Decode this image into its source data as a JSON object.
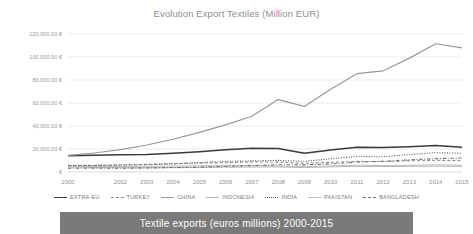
{
  "caption": {
    "text": "Textile exports (euros millions) 2000-2015",
    "bar_color": "#7a7a7a",
    "text_color": "#ffffff"
  },
  "chart_data": {
    "type": "line",
    "title": "Evolution Export Textiles (Million EUR)",
    "xlabel": "",
    "ylabel": "",
    "grid": true,
    "legend_position": "bottom",
    "ylim": [
      0,
      120000
    ],
    "ytick_values": [
      0,
      20000,
      40000,
      60000,
      80000,
      100000,
      120000
    ],
    "ytick_labels": [
      "-   €",
      "20,000.00 €",
      "40,000.00 €",
      "60,000.00 €",
      "80,000.00 €",
      "100,000.00 €",
      "120,000.00 €"
    ],
    "categories": [
      2000,
      2001,
      2002,
      2003,
      2004,
      2005,
      2006,
      2007,
      2008,
      2009,
      2010,
      2011,
      2012,
      2013,
      2014,
      2015
    ],
    "xtick_labels": [
      "2000",
      "2001",
      "2002",
      "2003",
      "2004",
      "2005",
      "2006",
      "2007",
      "2008",
      "2009",
      "2010",
      "2011",
      "2012",
      "2013",
      "2014",
      "2015"
    ],
    "xtick_visible": [
      "2000",
      "2002",
      "2003",
      "2004",
      "2005",
      "2006",
      "2007",
      "2008",
      "2009",
      "2010",
      "2011",
      "2012",
      "2013",
      "2014",
      "2015"
    ],
    "series": [
      {
        "name": "EXTRA-EU",
        "color": "#3a3a3a",
        "dash": "none",
        "width": 1.5,
        "values": [
          14200,
          14600,
          14900,
          15200,
          16200,
          17600,
          19300,
          20600,
          20400,
          16300,
          19200,
          21600,
          21300,
          22000,
          23000,
          21500
        ]
      },
      {
        "name": "TURKEY",
        "color": "#8d8d8d",
        "dash": "dashed",
        "width": 1.1,
        "values": [
          5600,
          5700,
          6100,
          6600,
          7300,
          7700,
          8100,
          8800,
          8600,
          7600,
          8400,
          9200,
          9100,
          9700,
          10200,
          9800
        ]
      },
      {
        "name": "CHINA",
        "color": "#9a9a9a",
        "dash": "none",
        "width": 1.2,
        "values": [
          14500,
          16500,
          19500,
          23500,
          28500,
          34500,
          41000,
          48500,
          63000,
          57000,
          72000,
          85500,
          88000,
          99000,
          111500,
          108000
        ]
      },
      {
        "name": "INDONESIA",
        "color": "#b4b4b4",
        "dash": "none",
        "width": 1.0,
        "values": [
          4300,
          3900,
          3800,
          3700,
          3800,
          3900,
          4200,
          4300,
          4400,
          3900,
          4500,
          5000,
          4800,
          4900,
          5100,
          4900
        ]
      },
      {
        "name": "INDIA",
        "color": "#5c5c5c",
        "dash": "dotted",
        "width": 1.1,
        "values": [
          5800,
          5700,
          6000,
          6400,
          7000,
          8200,
          9200,
          9700,
          10100,
          9300,
          11500,
          13500,
          13200,
          15200,
          16800,
          16300
        ]
      },
      {
        "name": "PAKISTAN",
        "color": "#bdbdbd",
        "dash": "none",
        "width": 1.0,
        "values": [
          4900,
          4700,
          4800,
          5000,
          5200,
          5400,
          5500,
          5500,
          5200,
          4600,
          5300,
          5900,
          5600,
          5900,
          6200,
          5900
        ]
      },
      {
        "name": "BANGLADESH",
        "color": "#707070",
        "dash": "dashdot",
        "width": 1.1,
        "values": [
          3300,
          3300,
          3200,
          3500,
          3900,
          4300,
          5000,
          5600,
          6300,
          6200,
          7000,
          8600,
          9300,
          10600,
          11600,
          12200
        ]
      }
    ]
  }
}
